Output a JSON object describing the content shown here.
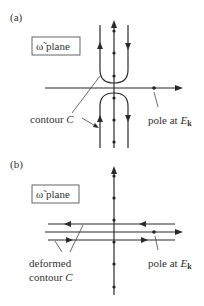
{
  "figure": {
    "panel_a": {
      "label": "(a)",
      "plane_label": "ω̃ plane",
      "contour_label_main": "contour ",
      "contour_label_var": "C",
      "pole_label_main": "pole at ",
      "pole_label_var": "E",
      "pole_label_sub": "k"
    },
    "panel_b": {
      "label": "(b)",
      "plane_label": "ω̃ plane",
      "contour_label_line1": "deformed",
      "contour_label_line2_main": "contour ",
      "contour_label_var": "C",
      "pole_label_main": "pole at ",
      "pole_label_var": "E",
      "pole_label_sub": "k"
    }
  },
  "colors": {
    "line": "#2a2a2a",
    "text": "#333333",
    "background": "#ffffff"
  }
}
